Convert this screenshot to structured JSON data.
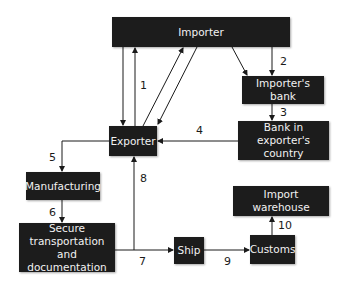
{
  "diagram": {
    "nodes": {
      "importer": "Importer",
      "importers_bank": "Importer's bank",
      "bank_exporter_country": "Bank in exporter's country",
      "exporter": "Exporter",
      "manufacturing": "Manufacturing",
      "secure_transport": "Secure transportation and documentation",
      "ship": "Ship",
      "customs": "Customs",
      "import_warehouse": "Import warehouse"
    },
    "step_labels": {
      "s1": "1",
      "s2": "2",
      "s3": "3",
      "s4": "4",
      "s5": "5",
      "s6": "6",
      "s7": "7",
      "s8": "8",
      "s9": "9",
      "s10": "10"
    },
    "edges": [
      {
        "from": "importer",
        "to": "exporter"
      },
      {
        "from": "exporter",
        "to": "importer",
        "label": "1"
      },
      {
        "from": "exporter",
        "to": "importer"
      },
      {
        "from": "importer",
        "to": "exporter"
      },
      {
        "from": "importer",
        "to": "importers_bank"
      },
      {
        "from": "importer",
        "to": "importers_bank",
        "label": "2"
      },
      {
        "from": "importers_bank",
        "to": "bank_exporter_country",
        "label": "3"
      },
      {
        "from": "bank_exporter_country",
        "to": "exporter",
        "label": "4"
      },
      {
        "from": "exporter",
        "to": "manufacturing",
        "label": "5"
      },
      {
        "from": "manufacturing",
        "to": "secure_transport",
        "label": "6"
      },
      {
        "from": "secure_transport",
        "to": "ship",
        "label": "7"
      },
      {
        "from": "secure_transport",
        "to": "exporter",
        "label": "8"
      },
      {
        "from": "ship",
        "to": "customs",
        "label": "9"
      },
      {
        "from": "customs",
        "to": "import_warehouse",
        "label": "10"
      }
    ],
    "colors": {
      "box": "#1c1c1c",
      "box_text": "#f2f2f2",
      "line": "#1a1a1a"
    }
  }
}
